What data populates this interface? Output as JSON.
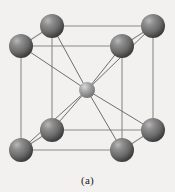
{
  "figure": {
    "caption": "(a)",
    "background_color": "#f3f1ef",
    "edge_color": "#8a8a8a",
    "diagonal_color": "#6e6e6e",
    "corner_atom_color": "#6a6a6a",
    "corner_atom_highlight": "#c9c9c9",
    "corner_atom_shadow": "#3a3a3a",
    "center_atom_color": "#9a9a9a",
    "center_atom_highlight": "#d8d8d8",
    "center_atom_shadow": "#6a6a6a",
    "corner_atom_radius": 12,
    "center_atom_radius": 8,
    "cube": {
      "front": {
        "top_left": [
          21,
          46
        ],
        "top_right": [
          122,
          46
        ],
        "bottom_right": [
          122,
          150
        ],
        "bottom_left": [
          21,
          150
        ]
      },
      "back": {
        "top_left": [
          52,
          26
        ],
        "top_right": [
          153,
          26
        ],
        "bottom_right": [
          153,
          130
        ],
        "bottom_left": [
          52,
          130
        ]
      }
    },
    "atoms": [
      {
        "name": "corner-back-top-left",
        "cx": 52,
        "cy": 26,
        "r": 12,
        "kind": "corner"
      },
      {
        "name": "corner-back-top-right",
        "cx": 153,
        "cy": 26,
        "r": 12,
        "kind": "corner"
      },
      {
        "name": "corner-front-top-left",
        "cx": 21,
        "cy": 46,
        "r": 12,
        "kind": "corner"
      },
      {
        "name": "corner-front-top-right",
        "cx": 122,
        "cy": 46,
        "r": 12,
        "kind": "corner"
      },
      {
        "name": "center-atom",
        "cx": 87,
        "cy": 90,
        "r": 8,
        "kind": "center"
      },
      {
        "name": "corner-back-bottom-left",
        "cx": 52,
        "cy": 130,
        "r": 12,
        "kind": "corner"
      },
      {
        "name": "corner-back-bottom-right",
        "cx": 153,
        "cy": 130,
        "r": 12,
        "kind": "corner"
      },
      {
        "name": "corner-front-bottom-left",
        "cx": 21,
        "cy": 150,
        "r": 12,
        "kind": "corner"
      },
      {
        "name": "corner-front-bottom-right",
        "cx": 122,
        "cy": 150,
        "r": 12,
        "kind": "corner"
      }
    ]
  }
}
